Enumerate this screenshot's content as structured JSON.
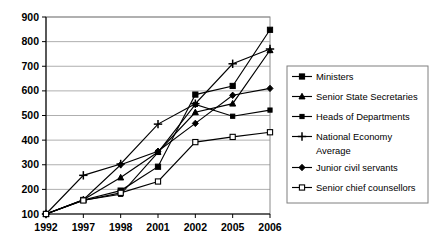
{
  "chart_data": {
    "type": "line",
    "title": "",
    "subtitle": "",
    "xlabel": "",
    "ylabel": "",
    "categories": [
      "1992",
      "1997",
      "1998",
      "2001",
      "2002",
      "2005",
      "2006"
    ],
    "ylim": [
      100,
      900
    ],
    "ytick_values": [
      100,
      200,
      300,
      400,
      500,
      600,
      700,
      800,
      900
    ],
    "ytick_labels": [
      "100",
      "200",
      "300",
      "400",
      "500",
      "600",
      "700",
      "800",
      "900"
    ],
    "grid": true,
    "legend_position": "right",
    "series": [
      {
        "name": "Ministers",
        "marker": "filled-square",
        "values": [
          100,
          157,
          195,
          292,
          585,
          620,
          848
        ]
      },
      {
        "name": "Senior State Secretaries",
        "marker": "filled-triangle",
        "values": [
          100,
          158,
          248,
          352,
          513,
          548,
          765
        ]
      },
      {
        "name": "Heads of Departments",
        "marker": "small-filled-square",
        "values": [
          100,
          156,
          180,
          350,
          545,
          497,
          522
        ]
      },
      {
        "name": "National Economy Average",
        "marker": "plus",
        "values": [
          100,
          257,
          303,
          465,
          548,
          710,
          770
        ]
      },
      {
        "name": "Junior civil servants",
        "marker": "filled-diamond",
        "values": [
          100,
          158,
          300,
          355,
          468,
          582,
          610
        ]
      },
      {
        "name": "Senior chief counsellors",
        "marker": "open-square",
        "values": [
          100,
          155,
          186,
          232,
          392,
          413,
          432
        ]
      }
    ]
  },
  "legend": {
    "items": [
      {
        "label": "Ministers"
      },
      {
        "label": "Senior State Secretaries"
      },
      {
        "label": "Heads of Departments"
      },
      {
        "label": "National Economy"
      },
      {
        "label": "Average"
      },
      {
        "label": "Junior civil servants"
      },
      {
        "label": "Senior chief counsellors"
      }
    ]
  },
  "colors": {
    "line": "#000000",
    "grid": "#9a9a9a",
    "frame": "#8a8a8a",
    "background": "#ffffff"
  }
}
